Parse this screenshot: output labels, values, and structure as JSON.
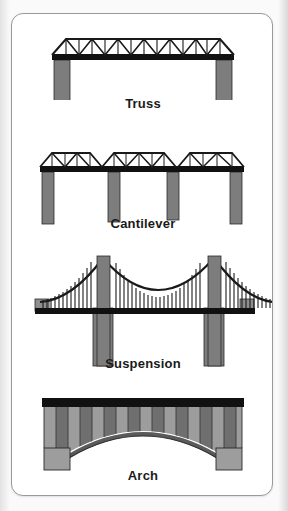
{
  "page": {
    "background_color": "#f7f7f7",
    "card_background": "#ffffff",
    "card_border_color": "#9a9a9a"
  },
  "diagram": {
    "title_visible": false,
    "palette": {
      "deck_dark": "#111111",
      "pier_gray": "#7d7d7d",
      "pier_gray_light": "#8e8e8e",
      "stone_light": "#9d9d9d",
      "stone_dark": "#6d6d6d",
      "outline": "#1a1a1a",
      "label_color": "#1a1a1a"
    },
    "panels": [
      {
        "id": "truss",
        "label": "Truss",
        "icon": "truss-bridge-icon",
        "description": "Flat deck with a triangulated lattice truss above, supported on two end piers",
        "spans": 1,
        "piers": 2,
        "truss_bays": 12
      },
      {
        "id": "cantilever",
        "label": "Cantilever",
        "icon": "cantilever-bridge-icon",
        "description": "Continuous deck with three truss sections resting on four piers",
        "spans": 3,
        "piers": 4,
        "truss_bays": 12
      },
      {
        "id": "suspension",
        "label": "Suspension",
        "icon": "suspension-bridge-icon",
        "description": "Main cable draped between two tall towers with vertical hanger cables to the deck",
        "towers": 2,
        "piers": 4,
        "hangers": 64
      },
      {
        "id": "arch",
        "label": "Arch",
        "icon": "arch-bridge-icon",
        "description": "Masonry arch of wedge voussoirs carrying a flat dark deck between two abutments",
        "voussoirs": 17,
        "abutments": 2
      }
    ]
  }
}
